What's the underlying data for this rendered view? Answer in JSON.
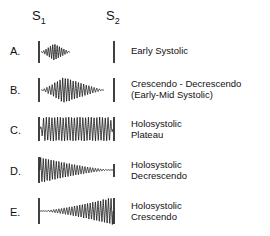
{
  "figure": {
    "title_absent": true,
    "background_color": "#ffffff",
    "stroke_color": "#111111",
    "width": 270,
    "height": 236
  },
  "header": {
    "markers": [
      {
        "name": "s1",
        "base": "S",
        "sub": "1",
        "x": 32,
        "y": 8,
        "tick_x": 39
      },
      {
        "name": "s2",
        "base": "S",
        "sub": "2",
        "x": 106,
        "y": 8,
        "tick_x": 114
      }
    ]
  },
  "chart_data": {
    "type": "line",
    "xlabel": "",
    "ylabel": "",
    "x_markers": [
      "S1",
      "S2"
    ],
    "s1_x": 39,
    "s2_x": 114,
    "series": [
      {
        "name": "Early Systolic",
        "letter": "A.",
        "envelope": "crescendo-decrescendo-short",
        "start_x": 41,
        "end_x": 70,
        "peak_fraction": 0.45,
        "max_amplitude": 9,
        "cycles": 13,
        "baseline_y": 52
      },
      {
        "name": "Crescendo - Decrescendo (Early-Mid Systolic)",
        "letter": "B.",
        "envelope": "crescendo-decrescendo",
        "start_x": 41,
        "end_x": 104,
        "peak_fraction": 0.36,
        "max_amplitude": 13,
        "cycles": 24,
        "baseline_y": 90
      },
      {
        "name": "Holosystolic Plateau",
        "letter": "C.",
        "envelope": "plateau",
        "start_x": 40,
        "end_x": 113,
        "peak_fraction": 0.5,
        "max_amplitude": 12,
        "cycles": 26,
        "baseline_y": 129
      },
      {
        "name": "Holosystolic Decrescendo",
        "letter": "D.",
        "envelope": "decrescendo",
        "start_x": 40,
        "end_x": 113,
        "peak_fraction": 0.0,
        "max_amplitude": 13,
        "cycles": 28,
        "baseline_y": 170
      },
      {
        "name": "Holosystolic Crescendo",
        "letter": "E.",
        "envelope": "crescendo",
        "start_x": 40,
        "end_x": 113,
        "peak_fraction": 1.0,
        "max_amplitude": 14,
        "cycles": 28,
        "baseline_y": 211
      }
    ]
  },
  "rows": [
    {
      "letter": "A.",
      "letter_x": 10,
      "letter_y": 45,
      "desc_x": 131,
      "desc_y": 45,
      "lines": [
        "Early Systolic"
      ],
      "ticks": [
        {
          "x": 39,
          "y1": 41,
          "y2": 63
        },
        {
          "x": 114,
          "y1": 41,
          "y2": 63
        }
      ]
    },
    {
      "letter": "B.",
      "letter_x": 10,
      "letter_y": 84,
      "desc_x": 131,
      "desc_y": 78,
      "lines": [
        "Crescendo - Decrescendo",
        "(Early-Mid Systolic)"
      ],
      "ticks": [
        {
          "x": 39,
          "y1": 78,
          "y2": 102
        },
        {
          "x": 114,
          "y1": 78,
          "y2": 102
        }
      ]
    },
    {
      "letter": "C.",
      "letter_x": 10,
      "letter_y": 124,
      "desc_x": 131,
      "desc_y": 118,
      "lines": [
        "Holosystolic",
        "Plateau"
      ],
      "ticks": [
        {
          "x": 39,
          "y1": 117,
          "y2": 141
        },
        {
          "x": 114,
          "y1": 117,
          "y2": 141
        }
      ]
    },
    {
      "letter": "D.",
      "letter_x": 10,
      "letter_y": 165,
      "desc_x": 131,
      "desc_y": 159,
      "lines": [
        "Holosystolic",
        "Decrescendo"
      ],
      "ticks": [
        {
          "x": 39,
          "y1": 157,
          "y2": 183
        },
        {
          "x": 114,
          "y1": 164,
          "y2": 177
        }
      ]
    },
    {
      "letter": "E.",
      "letter_x": 10,
      "letter_y": 206,
      "desc_x": 131,
      "desc_y": 200,
      "lines": [
        "Holosystolic",
        "Crescendo"
      ],
      "ticks": [
        {
          "x": 39,
          "y1": 198,
          "y2": 224
        },
        {
          "x": 114,
          "y1": 198,
          "y2": 224
        }
      ]
    }
  ]
}
